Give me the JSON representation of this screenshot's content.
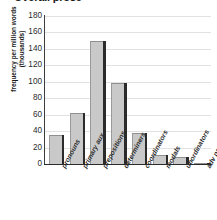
{
  "chart_data": {
    "type": "bar",
    "title": "Overall prose",
    "xlabel": "",
    "ylabel": "frequency per million words (thousands)",
    "ylim": [
      0,
      180
    ],
    "ytick_step": 20,
    "yticks": [
      180,
      160,
      140,
      120,
      100,
      80,
      60,
      40,
      20,
      0
    ],
    "grid": true,
    "legend": "none",
    "bar_style": "3d-shadowed",
    "bar_fill_color": "#c9c9c9",
    "bar_shadow_color": "#2b2b2b",
    "categories": [
      "pronouns",
      "primary aux",
      "prepositions",
      "determiners",
      "coordinators",
      "modals",
      "ubordinators",
      "adv particles"
    ],
    "values": [
      35,
      62,
      150,
      98,
      38,
      11,
      9,
      1.5
    ],
    "units": "thousands of occurrences per million words"
  },
  "axis": {
    "y_title": "frequency per million words (thousands)",
    "tick_labels": [
      "180",
      "160",
      "140",
      "120",
      "100",
      "80",
      "60",
      "40",
      "20",
      "0"
    ]
  },
  "header": {
    "title": "Overall prose"
  }
}
